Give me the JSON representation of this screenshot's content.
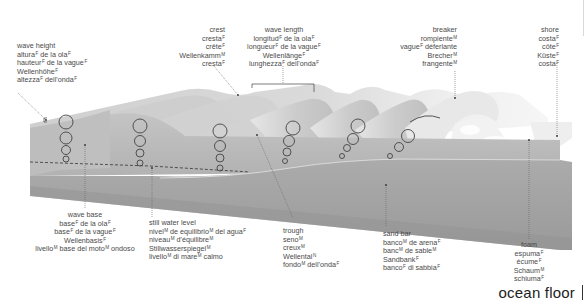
{
  "title": "ocean floor",
  "colors": {
    "water_face": "#b9b9b9",
    "water_top": "#d6d6d6",
    "sand_face": "#a6a6a6",
    "sand_dark": "#8f8f8f",
    "foam": "#f2f2f2",
    "text": "#4a4a4a",
    "leader": "#666666"
  },
  "labels": {
    "wave_height": {
      "en": "wave height",
      "es": {
        "text": "altura",
        "g": "F",
        "rest": " de la ola",
        "g2": "F"
      },
      "fr": {
        "text": "hauteur",
        "g": "F",
        "rest": " de la vague",
        "g2": "F"
      },
      "de": {
        "text": "Wellenhöhe",
        "g": "F"
      },
      "it": {
        "text": "altezza",
        "g": "F",
        "rest": " dell'onda",
        "g2": "F"
      }
    },
    "crest": {
      "en": "crest",
      "es": {
        "text": "cresta",
        "g": "F"
      },
      "fr": {
        "text": "crête",
        "g": "F"
      },
      "de": {
        "text": "Wellenkamm",
        "g": "M"
      },
      "it": {
        "text": "cresta",
        "g": "F"
      }
    },
    "wave_length": {
      "en": "wave length",
      "es": {
        "text": "longitud",
        "g": "F",
        "rest": " de la ola",
        "g2": "F"
      },
      "fr": {
        "text": "longueur",
        "g": "F",
        "rest": " de la vague",
        "g2": "F"
      },
      "de": {
        "text": "Wellenlänge",
        "g": "F"
      },
      "it": {
        "text": "lunghezza",
        "g": "F",
        "rest": " dell'onda",
        "g2": "F"
      }
    },
    "breaker": {
      "en": "breaker",
      "es": {
        "text": "rompiente",
        "g": "M"
      },
      "fr": {
        "text": "vague",
        "g": "F",
        "rest": " déferlante",
        "g2": ""
      },
      "de": {
        "text": "Brecher",
        "g": "M"
      },
      "it": {
        "text": "frangente",
        "g": "M"
      }
    },
    "shore": {
      "en": "shore",
      "es": {
        "text": "costa",
        "g": "F"
      },
      "fr": {
        "text": "côte",
        "g": "F"
      },
      "de": {
        "text": "Küste",
        "g": "F"
      },
      "it": {
        "text": "costa",
        "g": "F"
      }
    },
    "wave_base": {
      "en": "wave base",
      "es": {
        "text": "base",
        "g": "F",
        "rest": " de la ola",
        "g2": "F"
      },
      "fr": {
        "text": "base",
        "g": "F",
        "rest": " de la vague",
        "g2": "F"
      },
      "de": {
        "text": "Wellenbasis",
        "g": "F"
      },
      "it": {
        "text": "livello",
        "g": "M",
        "rest": " base del moto",
        "g2": "M",
        "rest2": " ondoso"
      }
    },
    "still_water_level": {
      "en": "still water level",
      "es": {
        "text": "nivel",
        "g": "M",
        "rest": " de equilibrio",
        "g2": "M",
        "rest2": " del agua",
        "g3": "F"
      },
      "fr": {
        "text": "niveau",
        "g": "M",
        "rest": " d'équilibre",
        "g2": "M"
      },
      "de": {
        "text": "Stillwasserspiegel",
        "g": "M"
      },
      "it": {
        "text": "livello",
        "g": "M",
        "rest": " di mare",
        "g2": "M",
        "rest2": " calmo"
      }
    },
    "trough": {
      "en": "trough",
      "es": {
        "text": "seno",
        "g": "M"
      },
      "fr": {
        "text": "creux",
        "g": "M"
      },
      "de": {
        "text": "Wellental",
        "g": "N"
      },
      "it": {
        "text": "fondo",
        "g": "M",
        "rest": " dell'onda",
        "g2": "F"
      }
    },
    "sand_bar": {
      "en": "sand bar",
      "es": {
        "text": "banco",
        "g": "M",
        "rest": " de arena",
        "g2": "F"
      },
      "fr": {
        "text": "banc",
        "g": "M",
        "rest": " de sable",
        "g2": "M"
      },
      "de": {
        "text": "Sandbank",
        "g": "F"
      },
      "it": {
        "text": "banco",
        "g": "F",
        "rest": " di sabbia",
        "g2": "F"
      }
    },
    "foam": {
      "en": "foam",
      "es": {
        "text": "espuma",
        "g": "F"
      },
      "fr": {
        "text": "écume",
        "g": "F"
      },
      "de": {
        "text": "Schaum",
        "g": "M"
      },
      "it": {
        "text": "schiuma",
        "g": "F"
      }
    }
  }
}
